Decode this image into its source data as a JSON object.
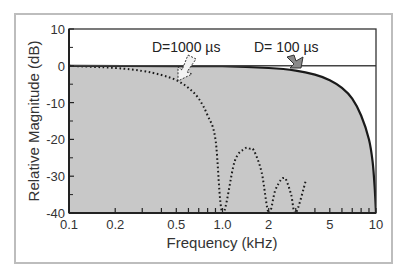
{
  "chart_data": {
    "type": "line",
    "title": "",
    "xlabel": "Frequency (kHz)",
    "ylabel": "Relative Magnitude (dB)",
    "xscale": "log",
    "xlim": [
      0.1,
      10
    ],
    "ylim": [
      -40,
      10
    ],
    "x_ticks": [
      "0.1",
      "0.2",
      "0.5",
      "1.0",
      "2",
      "5",
      "10"
    ],
    "y_ticks": [
      "10",
      "0",
      "-10",
      "-20",
      "-30",
      "-40"
    ],
    "grid": false,
    "legend": null,
    "fill": {
      "region": "below 0 dB, under D=100 µs curve",
      "color": "#c8c8c8"
    },
    "series": [
      {
        "name": "D=100 µs",
        "style": "solid",
        "color": "#1a1a1a",
        "x": [
          0.1,
          0.5,
          1.0,
          2.0,
          3.0,
          4.0,
          5.0,
          6.0,
          7.0,
          8.0,
          9.0,
          9.5,
          9.8,
          10.0
        ],
        "y": [
          0,
          -0.1,
          -0.1,
          -0.6,
          -1.3,
          -2.4,
          -3.9,
          -6.0,
          -8.9,
          -13.5,
          -20,
          -26,
          -33,
          -40
        ]
      },
      {
        "name": "D=1000 µs",
        "style": "dotted",
        "color": "#1a1a1a",
        "x": [
          0.1,
          0.2,
          0.3,
          0.4,
          0.5,
          0.6,
          0.7,
          0.8,
          0.9,
          1.0,
          1.2,
          1.4,
          1.5,
          1.6,
          1.8,
          2.0,
          2.2,
          2.4,
          2.5,
          2.6,
          2.8,
          3.0,
          3.5
        ],
        "y": [
          0,
          -0.6,
          -1.4,
          -2.5,
          -3.9,
          -6.0,
          -8.9,
          -13.5,
          -20,
          -40,
          -26,
          -22.5,
          -22.5,
          -23,
          -29,
          -40,
          -34,
          -31,
          -30.5,
          -31,
          -35,
          -40,
          -31
        ]
      }
    ],
    "annotations": [
      {
        "text": "D=1000 µs",
        "arrow": "open/dashed outline",
        "points_to": {
          "x": 0.55,
          "y": -2
        }
      },
      {
        "text": "D= 100 µs",
        "arrow": "solid gray",
        "points_to": {
          "x": 2.9,
          "y": 0
        }
      }
    ]
  }
}
